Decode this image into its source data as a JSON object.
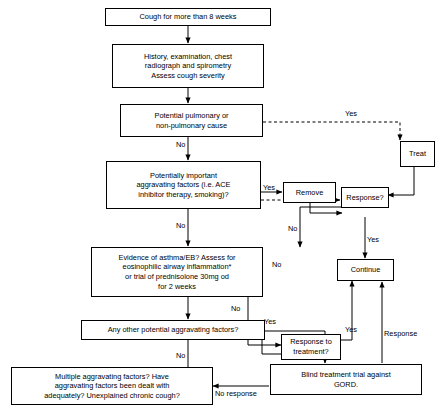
{
  "diagram": {
    "nodes": [
      {
        "id": "start",
        "label": "Cough for more than 8 weeks"
      },
      {
        "id": "history",
        "label": "History, examination, chest\nradiograph and spirometry\nAssess cough severity"
      },
      {
        "id": "potential_cause",
        "label": "Potential pulmonary or\nnon-pulmonary cause"
      },
      {
        "id": "aggravating",
        "label": "Potentially important\naggravating factors (i.e. ACE\ninhibitor therapy, smoking)?"
      },
      {
        "id": "remove",
        "label": "Remove"
      },
      {
        "id": "treat",
        "label": "Treat"
      },
      {
        "id": "response1",
        "label": "Response?"
      },
      {
        "id": "asthma",
        "label": "Evidence of asthma/EB? Assess for\neosinophilic airway inflammation*\nor trial of prednisolone 30mg od\nfor 2 weeks"
      },
      {
        "id": "continue",
        "label": "Continue"
      },
      {
        "id": "other_factors",
        "label": "Any other potential aggravating factors?"
      },
      {
        "id": "response2",
        "label": "Response to\ntreatment?"
      },
      {
        "id": "gord",
        "label": "Blind treatment trial against\nGORD."
      },
      {
        "id": "multiple",
        "label": "Multiple aggravating factors?  Have\naggravating factors been dealt with\nadequately? Unexplained chronic cough?"
      }
    ],
    "edge_labels": [
      {
        "id": "lbl-no-1",
        "text": "No"
      },
      {
        "id": "lbl-yes-1",
        "text": "Yes"
      },
      {
        "id": "lbl-no-2",
        "text": "No"
      },
      {
        "id": "lbl-yes-2",
        "text": "Yes"
      },
      {
        "id": "lbl-no-3",
        "text": "No"
      },
      {
        "id": "lbl-no-4",
        "text": "No"
      },
      {
        "id": "lbl-yes-3",
        "text": "Yes"
      },
      {
        "id": "lbl-no-5",
        "text": "No"
      },
      {
        "id": "lbl-yes-4",
        "text": "Yes"
      },
      {
        "id": "lbl-yes-5",
        "text": "Yes"
      },
      {
        "id": "lbl-no-6",
        "text": "No"
      },
      {
        "id": "lbl-response",
        "text": "Response"
      },
      {
        "id": "lbl-no-response",
        "text": "No response"
      }
    ]
  }
}
